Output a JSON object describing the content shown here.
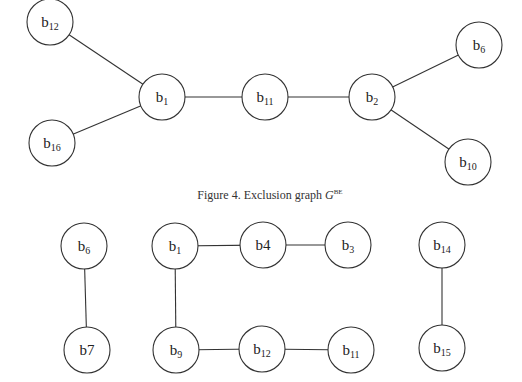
{
  "figure": {
    "caption_prefix": "Figure 4. Exclusion graph ",
    "caption_symbol": "G",
    "caption_superscript": "BE"
  },
  "graphs": [
    {
      "id": "exclusion-graph",
      "nodes": [
        {
          "id": "t_b12",
          "base": "b",
          "sub": "12",
          "x": 50,
          "y": 22
        },
        {
          "id": "t_b16",
          "base": "b",
          "sub": "16",
          "x": 52,
          "y": 143
        },
        {
          "id": "t_b1",
          "base": "b",
          "sub": "1",
          "x": 162,
          "y": 97
        },
        {
          "id": "t_b11",
          "base": "b",
          "sub": "11",
          "x": 265,
          "y": 97
        },
        {
          "id": "t_b2",
          "base": "b",
          "sub": "2",
          "x": 372,
          "y": 97
        },
        {
          "id": "t_b6",
          "base": "b",
          "sub": "6",
          "x": 479,
          "y": 45
        },
        {
          "id": "t_b10",
          "base": "b",
          "sub": "10",
          "x": 468,
          "y": 162
        }
      ],
      "edges": [
        [
          "t_b12",
          "t_b1"
        ],
        [
          "t_b16",
          "t_b1"
        ],
        [
          "t_b1",
          "t_b11"
        ],
        [
          "t_b11",
          "t_b2"
        ],
        [
          "t_b2",
          "t_b6"
        ],
        [
          "t_b2",
          "t_b10"
        ]
      ]
    },
    {
      "id": "bottom-graph",
      "nodes": [
        {
          "id": "m_b6",
          "base": "b",
          "sub": "6",
          "x": 84,
          "y": 246
        },
        {
          "id": "m_b7",
          "base": "b7",
          "sub": "",
          "x": 87,
          "y": 350
        },
        {
          "id": "m_b1",
          "base": "b",
          "sub": "1",
          "x": 175,
          "y": 246
        },
        {
          "id": "m_b4",
          "base": "b4",
          "sub": "",
          "x": 263,
          "y": 245
        },
        {
          "id": "m_b3",
          "base": "b",
          "sub": "3",
          "x": 348,
          "y": 245
        },
        {
          "id": "m_b9",
          "base": "b",
          "sub": "9",
          "x": 176,
          "y": 350
        },
        {
          "id": "m_b12",
          "base": "b",
          "sub": "12",
          "x": 262,
          "y": 349
        },
        {
          "id": "m_b11",
          "base": "b",
          "sub": "11",
          "x": 351,
          "y": 350
        },
        {
          "id": "m_b14",
          "base": "b",
          "sub": "14",
          "x": 442,
          "y": 245
        },
        {
          "id": "m_b15",
          "base": "b",
          "sub": "15",
          "x": 442,
          "y": 348
        }
      ],
      "edges": [
        [
          "m_b6",
          "m_b7"
        ],
        [
          "m_b1",
          "m_b4"
        ],
        [
          "m_b4",
          "m_b3"
        ],
        [
          "m_b1",
          "m_b9"
        ],
        [
          "m_b9",
          "m_b12"
        ],
        [
          "m_b12",
          "m_b11"
        ],
        [
          "m_b14",
          "m_b15"
        ]
      ]
    }
  ],
  "style": {
    "node_radius": 23,
    "stroke_color": "#333333",
    "background": "#ffffff"
  }
}
